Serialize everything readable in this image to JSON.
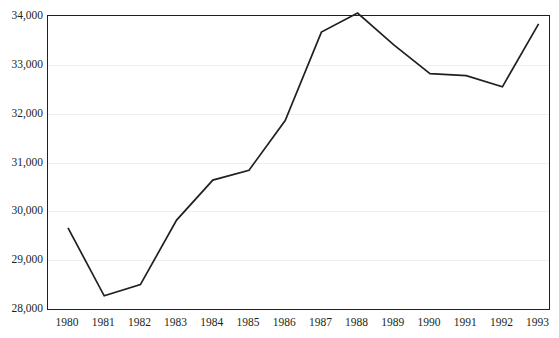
{
  "top_caption": "",
  "chart_data": {
    "type": "line",
    "title": "",
    "subtitle": "",
    "xlabel": "",
    "ylabel": "",
    "categories": [
      "1980",
      "1981",
      "1982",
      "1983",
      "1984",
      "1985",
      "1986",
      "1987",
      "1988",
      "1989",
      "1990",
      "1991",
      "1992",
      "1993"
    ],
    "series": [
      {
        "name": "series-1",
        "values": [
          29660,
          28270,
          28500,
          29820,
          30640,
          30840,
          31860,
          33670,
          34060,
          33410,
          32820,
          32780,
          32550,
          33840
        ]
      }
    ],
    "ylim": [
      28000,
      34000
    ],
    "ytick_values": [
      34000,
      33000,
      32000,
      31000,
      30000,
      29000,
      28000
    ],
    "ytick_labels": [
      "34,000",
      "33,000",
      "32,000",
      "31,000",
      "30,000",
      "29,000",
      "28,000"
    ],
    "xtick_labels": [
      "1980",
      "1981",
      "1982",
      "1983",
      "1984",
      "1985",
      "1986",
      "1987",
      "1988",
      "1989",
      "1990",
      "1991",
      "1992",
      "1993"
    ],
    "grid": true,
    "grid_axis": "y",
    "legend": false,
    "legend_position": "none",
    "line_color": "#231f20",
    "grid_color": "#efeff1",
    "frame_color": "#231f20",
    "background_color": "#ffffff",
    "markers": false,
    "annotations": []
  }
}
